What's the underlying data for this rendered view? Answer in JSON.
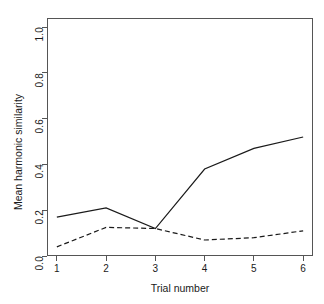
{
  "chart_data": {
    "type": "line",
    "title": "",
    "xlabel": "Trial number",
    "ylabel": "Mean harmonic similarity",
    "x": [
      1,
      2,
      3,
      4,
      5,
      6
    ],
    "xlim": [
      0.8,
      6.2
    ],
    "ylim": [
      0.0,
      1.04
    ],
    "xticks": [
      "1",
      "2",
      "3",
      "4",
      "5",
      "6"
    ],
    "yticks": [
      "0.0",
      "0.2",
      "0.4",
      "0.6",
      "0.8",
      "1.0"
    ],
    "ytick_values": [
      0.0,
      0.2,
      0.4,
      0.6,
      0.8,
      1.0
    ],
    "grid": false,
    "legend": "none",
    "series": [
      {
        "name": "solid-series",
        "style": "solid",
        "color": "#1a1a1a",
        "values": [
          0.17,
          0.21,
          0.12,
          0.38,
          0.47,
          0.52
        ]
      },
      {
        "name": "dashed-series",
        "style": "dashed",
        "color": "#1a1a1a",
        "values": [
          0.04,
          0.125,
          0.12,
          0.07,
          0.08,
          0.11
        ]
      }
    ]
  }
}
